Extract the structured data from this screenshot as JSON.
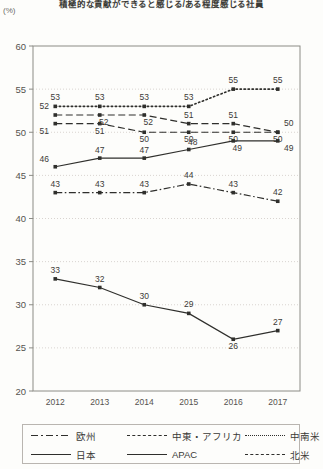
{
  "chart_data": {
    "type": "line",
    "title": "積極的な貢献ができると感じる/ある程度感じる社員",
    "unit_label": "(%)",
    "xlabel": "",
    "ylabel": "",
    "categories": [
      "2012",
      "2013",
      "2014",
      "2015",
      "2016",
      "2017"
    ],
    "ylim": [
      20,
      60
    ],
    "ytick_labels": [
      "20",
      "25",
      "30",
      "35",
      "40",
      "45",
      "50",
      "55",
      "60"
    ],
    "ytick_values": [
      20,
      25,
      30,
      35,
      40,
      45,
      50,
      55,
      60
    ],
    "grid": true,
    "legend_position": "bottom",
    "series": [
      {
        "name": "欧州",
        "style": "dashdot",
        "values": [
          43,
          43,
          43,
          44,
          43,
          42
        ]
      },
      {
        "name": "中東・アフリカ",
        "style": "dashed",
        "values": [
          51,
          51,
          50,
          50,
          50,
          50
        ]
      },
      {
        "name": "中南米",
        "style": "dotted",
        "values": [
          53,
          53,
          53,
          53,
          55,
          55
        ]
      },
      {
        "name": "日本",
        "style": "solid",
        "values": [
          33,
          32,
          30,
          29,
          26,
          27
        ]
      },
      {
        "name": "APAC",
        "style": "solid",
        "values": [
          46,
          47,
          47,
          48,
          49,
          49
        ]
      },
      {
        "name": "北米",
        "style": "dashed",
        "values": [
          52,
          52,
          52,
          51,
          51,
          50
        ]
      }
    ]
  },
  "legend": {
    "items": [
      {
        "label": "欧州",
        "style": "dashdot"
      },
      {
        "label": "中東・アフリカ",
        "style": "dashed"
      },
      {
        "label": "中南米",
        "style": "dotted"
      },
      {
        "label": "日本",
        "style": "solid"
      },
      {
        "label": "APAC",
        "style": "solid"
      },
      {
        "label": "北米",
        "style": "dashed"
      }
    ]
  }
}
